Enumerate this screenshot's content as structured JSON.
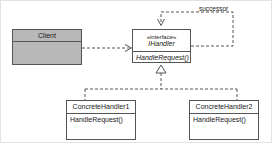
{
  "diagram": {
    "type": "uml-class-diagram",
    "colors": {
      "line": "#555555",
      "shaded_fill": "#b8b8b8",
      "plain_fill": "#ffffff",
      "text": "#1a1a1a",
      "frame": "#e2e2e2"
    },
    "classes": [
      {
        "id": "client",
        "name": "Client",
        "stereotype": "",
        "abstract": false,
        "shaded": true,
        "operations": []
      },
      {
        "id": "ihandler",
        "name": "IHandler",
        "stereotype": "«interface»",
        "abstract": true,
        "shaded": false,
        "operations": [
          "HandleRequest()"
        ]
      },
      {
        "id": "concretehandler1",
        "name": "ConcreteHandler1",
        "stereotype": "",
        "abstract": false,
        "shaded": false,
        "operations": [
          "HandleRequest()"
        ]
      },
      {
        "id": "concretehandler2",
        "name": "ConcreteHandler2",
        "stereotype": "",
        "abstract": false,
        "shaded": false,
        "operations": [
          "HandleRequest()"
        ]
      }
    ],
    "relations": [
      {
        "id": "client-uses-ihandler",
        "kind": "dependency",
        "from": "client",
        "to": "ihandler",
        "label": "",
        "style": "dashed",
        "arrow": "open"
      },
      {
        "id": "ihandler-successor",
        "kind": "association",
        "from": "ihandler",
        "to": "ihandler",
        "label": "successor",
        "style": "dashed",
        "arrow": "open"
      },
      {
        "id": "concretehandler1-realizes",
        "kind": "realization",
        "from": "concretehandler1",
        "to": "ihandler",
        "label": "",
        "style": "dashed",
        "arrow": "hollow-triangle"
      },
      {
        "id": "concretehandler2-realizes",
        "kind": "realization",
        "from": "concretehandler2",
        "to": "ihandler",
        "label": "",
        "style": "dashed",
        "arrow": "hollow-triangle"
      }
    ]
  }
}
